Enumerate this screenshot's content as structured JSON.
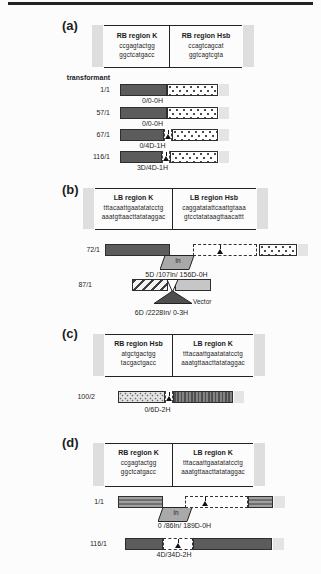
{
  "colors": {
    "dark_bar": "#5c5c5c",
    "light_bar": "#c6c6c6",
    "ribbon_fill": "#a9a9a9",
    "vector_fill": "#4f4f4f",
    "top_rule": "#222222"
  },
  "panels": {
    "a": {
      "label": "(a)",
      "transformant_label": "transformant",
      "table": {
        "left": {
          "title": "RB region K",
          "seq_top": "ccgagtactgg",
          "seq_bottom": "ggctcatgacc"
        },
        "right": {
          "title": "RB region Hsb",
          "seq_top": "ccagtcagcat",
          "seq_bottom": "ggtcagtcgta"
        }
      },
      "rows": [
        {
          "name": "1/1",
          "caption": "0/0-0H"
        },
        {
          "name": "57/1",
          "caption": "0/0-0H"
        },
        {
          "name": "67/1",
          "caption": "0/4D-1H"
        },
        {
          "name": "116/1",
          "caption": "3D/4D-1H"
        }
      ]
    },
    "b": {
      "label": "(b)",
      "table": {
        "left": {
          "title": "LB region K",
          "seq_top": "tttacaattgaatatatcctg",
          "seq_bottom": "aaatgttaacttatataggac"
        },
        "right": {
          "title": "LB region Hsb",
          "seq_top": "caggatatattcaattgtaaa",
          "seq_bottom": "gtcctatataagttaacattt"
        }
      },
      "rows": [
        {
          "name": "72/1",
          "insertion_label": "In",
          "caption": "5D /107In/ 156D-0H"
        },
        {
          "name": "87/1",
          "vector_label": "Vector",
          "caption": "6D /2228In/ 0-3H"
        }
      ]
    },
    "c": {
      "label": "(c)",
      "table": {
        "left": {
          "title": "RB region Hsb",
          "seq_top": "atgctgactgg",
          "seq_bottom": "tacgactgacc"
        },
        "right": {
          "title": "LB region K",
          "seq_top": "tttacaattgaatatatcctg",
          "seq_bottom": "aaatgttaacttatataggac"
        }
      },
      "rows": [
        {
          "name": "100/2",
          "caption": "0/6D-2H"
        }
      ]
    },
    "d": {
      "label": "(d)",
      "table": {
        "left": {
          "title": "RB region K",
          "seq_top": "ccgagtactgg",
          "seq_bottom": "ggctcatgacc"
        },
        "right": {
          "title": "LB region K",
          "seq_top": "tttacaattgaatatatcctg",
          "seq_bottom": "aaatgttaacttatataggac"
        }
      },
      "rows": [
        {
          "name": "1/1",
          "insertion_label": "In",
          "caption": "0 /86In/ 189D-0H"
        },
        {
          "name": "116/1",
          "caption": "4D/34D-2H"
        }
      ]
    }
  }
}
